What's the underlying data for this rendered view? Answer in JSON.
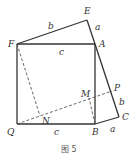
{
  "figure": {
    "caption": "图 5",
    "points": {
      "E": {
        "label": "E",
        "x": 87,
        "y": 20
      },
      "F": {
        "label": "F",
        "x": 17,
        "y": 44
      },
      "A": {
        "label": "A",
        "x": 95,
        "y": 44
      },
      "Q": {
        "label": "Q",
        "x": 17,
        "y": 124
      },
      "B": {
        "label": "B",
        "x": 95,
        "y": 124
      },
      "C": {
        "label": "C",
        "x": 119,
        "y": 117
      },
      "P": {
        "label": "P",
        "x": 112,
        "y": 91
      },
      "M": {
        "label": "M",
        "x": 89,
        "y": 98
      },
      "N": {
        "label": "N",
        "x": 40,
        "y": 116
      }
    },
    "side_labels": {
      "FE": "b",
      "EA": "a",
      "FA": "c",
      "QB": "c",
      "PC": "b",
      "BC": "a"
    }
  }
}
